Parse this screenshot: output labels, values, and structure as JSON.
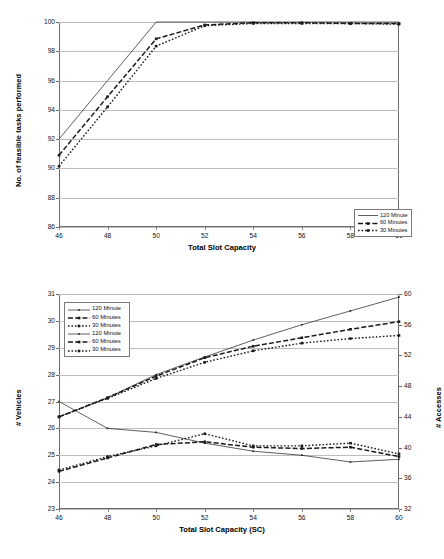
{
  "chart_data": [
    {
      "id": "top",
      "type": "line",
      "title": "",
      "xlabel": "Total Slot Capacity",
      "ylabel": "No. of feasible tasks performed",
      "xlim": [
        46,
        60
      ],
      "ylim": [
        86,
        100
      ],
      "xticks": [
        46,
        48,
        50,
        52,
        54,
        56,
        58,
        60
      ],
      "yticks": [
        86,
        88,
        90,
        92,
        94,
        96,
        98,
        100
      ],
      "grid": true,
      "legend_position": "bottom-right",
      "x": [
        46,
        48,
        50,
        52,
        54,
        56,
        58,
        60
      ],
      "series": [
        {
          "name": "120 Minute",
          "style": "solid-thin",
          "marker": "none",
          "values": [
            92.0,
            96.0,
            100.0,
            100.0,
            100.0,
            100.0,
            100.0,
            100.0
          ]
        },
        {
          "name": "60 Minutes",
          "style": "dashed-thick",
          "marker": "square",
          "values": [
            90.9,
            94.9,
            98.85,
            99.8,
            99.95,
            99.95,
            99.9,
            99.9
          ]
        },
        {
          "name": "30 Minutes",
          "style": "dotted-thick",
          "marker": "square",
          "values": [
            90.15,
            94.2,
            98.35,
            99.75,
            99.9,
            99.9,
            99.9,
            99.85
          ]
        }
      ]
    },
    {
      "id": "bottom",
      "type": "line",
      "title": "",
      "xlabel": "Total Slot Capacity (SC)",
      "ylabel_left": "# Vehicles",
      "ylabel_right": "# Accesses",
      "xlim": [
        46,
        60
      ],
      "ylim_left": [
        23,
        31
      ],
      "ylim_right": [
        32,
        60
      ],
      "xticks": [
        46,
        48,
        50,
        52,
        54,
        56,
        58,
        60
      ],
      "yticks_left": [
        23,
        24,
        25,
        26,
        27,
        28,
        29,
        30,
        31
      ],
      "yticks_right": [
        32,
        36,
        40,
        44,
        48,
        52,
        56,
        60
      ],
      "grid": true,
      "legend_position": "top-left",
      "x": [
        46,
        48,
        50,
        52,
        54,
        56,
        58,
        60
      ],
      "series": [
        {
          "name": "120 Minute",
          "axis": "left",
          "style": "solid-thin",
          "marker": "dot",
          "values": [
            27.0,
            26.0,
            25.85,
            25.45,
            25.15,
            25.0,
            24.75,
            24.85
          ]
        },
        {
          "name": "60 Minutes",
          "axis": "left",
          "style": "dashed-thick",
          "marker": "square",
          "values": [
            24.4,
            24.9,
            25.4,
            25.5,
            25.3,
            25.25,
            25.3,
            24.95
          ]
        },
        {
          "name": "30 Minutes",
          "axis": "left",
          "style": "dotted-thick",
          "marker": "square",
          "values": [
            24.45,
            24.95,
            25.35,
            25.8,
            25.35,
            25.35,
            25.45,
            25.05
          ]
        },
        {
          "name": "120 Minute",
          "axis": "right",
          "style": "solid-thin",
          "marker": "dot",
          "values": [
            44.0,
            46.5,
            49.5,
            51.8,
            54.0,
            56.0,
            57.8,
            59.6
          ]
        },
        {
          "name": "60 Minutes",
          "axis": "right",
          "style": "dashed-thick",
          "marker": "square",
          "values": [
            44.0,
            46.5,
            49.3,
            51.7,
            53.2,
            54.3,
            55.4,
            56.4
          ]
        },
        {
          "name": "30 Minutes",
          "axis": "right",
          "style": "dotted-thick",
          "marker": "square",
          "values": [
            44.0,
            46.4,
            49.0,
            51.1,
            52.6,
            53.6,
            54.2,
            54.6
          ]
        }
      ]
    }
  ],
  "top_chart": {
    "xlabel": "Total Slot Capacity",
    "ylabel": "No. of feasible tasks performed",
    "xticks": [
      "46",
      "48",
      "50",
      "52",
      "54",
      "56",
      "58",
      "60"
    ],
    "yticks": [
      "100",
      "98",
      "96",
      "94",
      "92",
      "90",
      "88",
      "86"
    ],
    "legend": [
      {
        "label": "120 Minute"
      },
      {
        "label": "60 Minutes"
      },
      {
        "label": "30 Minutes"
      }
    ]
  },
  "bottom_chart": {
    "xlabel": "Total Slot Capacity (SC)",
    "ylabel_left": "# Vehicles",
    "ylabel_right": "# Accesses",
    "xticks": [
      "46",
      "48",
      "50",
      "52",
      "54",
      "56",
      "58",
      "60"
    ],
    "yticks_left": [
      "31",
      "30",
      "29",
      "28",
      "27",
      "26",
      "25",
      "24",
      "23"
    ],
    "yticks_right": [
      "60",
      "56",
      "52",
      "48",
      "44",
      "40",
      "36",
      "32"
    ],
    "legend": [
      {
        "label": "120 Minute"
      },
      {
        "label": "60 Minutes"
      },
      {
        "label": "30 Minutes"
      },
      {
        "label": "120 Minute"
      },
      {
        "label": "60 Minutes"
      },
      {
        "label": "30 Minutes"
      }
    ]
  },
  "colors": {
    "line": "#1a1a1a",
    "grid": "#bdbdbd",
    "frame": "#6b6b6b",
    "background": "#ffffff"
  }
}
